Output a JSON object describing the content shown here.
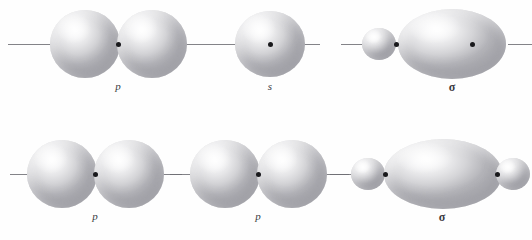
{
  "figure": {
    "background_color": "#fefefe",
    "width": 532,
    "height": 240,
    "lobe_fill_light": "#fdfdfd",
    "lobe_fill_dark": "#aeaeb3",
    "nucleus_color": "#19191c",
    "axis_color": "#6d6d73"
  },
  "rows": [
    {
      "name": "top-row",
      "axis_y": 44,
      "label_y": 80,
      "groups": [
        {
          "name": "p-orbital-top",
          "label": "p",
          "label_x": 118,
          "label_style": "italic",
          "axes": [
            {
              "x": 8,
              "width": 46
            },
            {
              "x": 183,
              "width": 42
            }
          ],
          "lobes": [
            {
              "cx": 85,
              "cy": 44,
              "rx": 35,
              "ry": 34
            },
            {
              "cx": 152,
              "cy": 44,
              "rx": 35,
              "ry": 34
            }
          ],
          "nuclei": [
            {
              "x": 118,
              "y": 44
            }
          ]
        },
        {
          "name": "s-orbital-top",
          "label": "s",
          "label_x": 270,
          "label_style": "italic",
          "axes": [
            {
              "x": 225,
              "width": 22
            },
            {
              "x": 296,
              "width": 24
            }
          ],
          "lobes": [
            {
              "cx": 270,
              "cy": 44,
              "rx": 35,
              "ry": 33
            }
          ],
          "nuclei": [
            {
              "x": 270,
              "y": 44
            }
          ]
        },
        {
          "name": "sigma-orbital-top",
          "label": "σ",
          "label_x": 452,
          "label_style": "sigma",
          "axes": [
            {
              "x": 341,
              "width": 24
            },
            {
              "x": 508,
              "width": 24
            }
          ],
          "lobes": [
            {
              "cx": 379,
              "cy": 44,
              "rx": 17,
              "ry": 16
            },
            {
              "cx": 452,
              "cy": 44,
              "rx": 54,
              "ry": 35
            }
          ],
          "nuclei": [
            {
              "x": 396,
              "y": 44
            },
            {
              "x": 472,
              "y": 44
            }
          ]
        }
      ]
    },
    {
      "name": "bottom-row",
      "axis_y": 174,
      "label_y": 210,
      "groups": [
        {
          "name": "p-orbital-bottom-left",
          "label": "p",
          "label_x": 95,
          "label_style": "italic",
          "axes": [
            {
              "x": 10,
              "width": 18
            },
            {
              "x": 162,
              "width": 20
            }
          ],
          "lobes": [
            {
              "cx": 62,
              "cy": 174,
              "rx": 35,
              "ry": 34
            },
            {
              "cx": 129,
              "cy": 174,
              "rx": 35,
              "ry": 34
            }
          ],
          "nuclei": [
            {
              "x": 95,
              "y": 174
            }
          ]
        },
        {
          "name": "p-orbital-bottom-right",
          "label": "p",
          "label_x": 258,
          "label_style": "italic",
          "axes": [
            {
              "x": 170,
              "width": 20
            },
            {
              "x": 325,
              "width": 24
            }
          ],
          "lobes": [
            {
              "cx": 225,
              "cy": 174,
              "rx": 35,
              "ry": 34
            },
            {
              "cx": 292,
              "cy": 174,
              "rx": 35,
              "ry": 34
            }
          ],
          "nuclei": [
            {
              "x": 258,
              "y": 174
            }
          ]
        },
        {
          "name": "sigma-orbital-bottom",
          "label": "σ",
          "label_x": 442,
          "label_style": "sigma",
          "axes": [
            {
              "x": 330,
              "width": 24
            }
          ],
          "lobes": [
            {
              "cx": 368,
              "cy": 174,
              "rx": 17,
              "ry": 16
            },
            {
              "cx": 443,
              "cy": 174,
              "rx": 59,
              "ry": 35
            },
            {
              "cx": 513,
              "cy": 174,
              "rx": 17,
              "ry": 16
            }
          ],
          "nuclei": [
            {
              "x": 385,
              "y": 174
            },
            {
              "x": 497,
              "y": 174
            }
          ]
        }
      ]
    }
  ]
}
